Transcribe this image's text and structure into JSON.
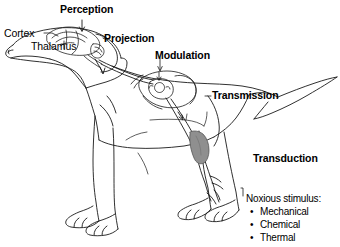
{
  "figure": {
    "background_color": "#ffffff",
    "line_color": "#1a1a1a",
    "shade_color": "#8a8a8a",
    "text_color": "#000000"
  },
  "labels": {
    "perception": "Perception",
    "cortex": "Cortex",
    "thalamus": "Thalamus",
    "projection": "Projection",
    "modulation": "Modulation",
    "transmission": "Transmission",
    "transduction": "Transduction"
  },
  "noxious_stimulus": {
    "heading": "Noxious stimulus:",
    "bullet_glyph": "•",
    "items": [
      "Mechanical",
      "Chemical",
      "Thermal"
    ]
  },
  "anatomy": {
    "parts": [
      "dog-body-outline",
      "dog-head",
      "brain-cross-section",
      "spinal-cord-cross-section",
      "nerve-pathway",
      "hind-leg-nerve-shading",
      "tail"
    ]
  }
}
